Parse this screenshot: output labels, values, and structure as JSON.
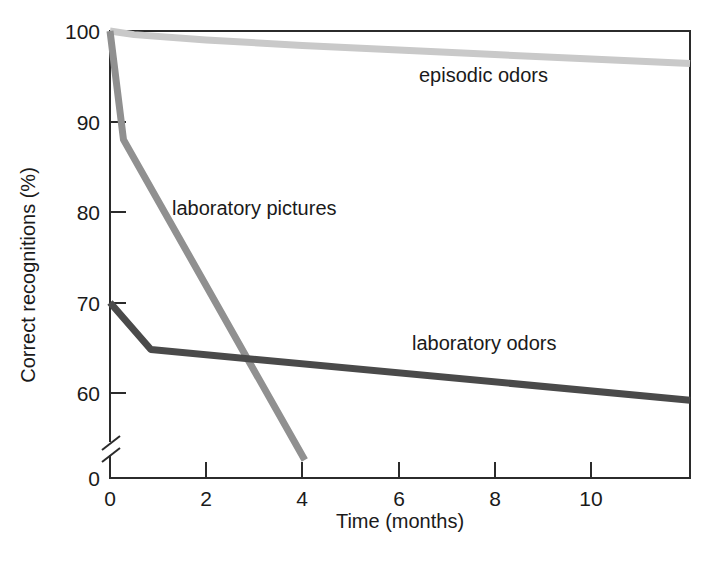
{
  "chart_data": {
    "type": "line",
    "title": "",
    "xlabel": "Time (months)",
    "ylabel": "Correct recognitions (%)",
    "xlim": [
      0,
      12.06
    ],
    "ylim": [
      56.0,
      100.8
    ],
    "y_axis_break": true,
    "y_break_label": "0",
    "grid": false,
    "legend": "inline-annotations",
    "xticks": [
      0,
      2,
      4,
      6,
      8,
      10
    ],
    "xtick_labels": [
      "0",
      "2",
      "4",
      "6",
      "8",
      "10"
    ],
    "yticks": [
      60,
      70,
      80,
      90,
      100
    ],
    "ytick_labels": [
      "60",
      "70",
      "80",
      "90",
      "100"
    ],
    "series": [
      {
        "name": "episodic odors",
        "color": "#c9c9c9",
        "label_x": 5.05,
        "label_y": 93.6,
        "x": [
          0,
          0.5,
          2,
          4,
          6,
          8,
          10,
          12.06
        ],
        "values": [
          100,
          99.6,
          99.0,
          98.4,
          97.9,
          97.4,
          96.9,
          96.4
        ]
      },
      {
        "name": "laboratory pictures",
        "color": "#909090",
        "label_x": 1.3,
        "label_y": 80.0,
        "x": [
          0,
          0.28,
          4.05
        ],
        "values": [
          100,
          88.0,
          52.6
        ]
      },
      {
        "name": "laboratory odors",
        "color": "#4a4a4a",
        "label_x": 6.9,
        "label_y": 66.3,
        "x": [
          0,
          0.85,
          12.06
        ],
        "values": [
          70,
          64.8,
          59.2
        ]
      }
    ]
  },
  "axes": {
    "y_title": "Correct recognitions (%)",
    "x_title": "Time (months)",
    "zero_label": "0"
  }
}
